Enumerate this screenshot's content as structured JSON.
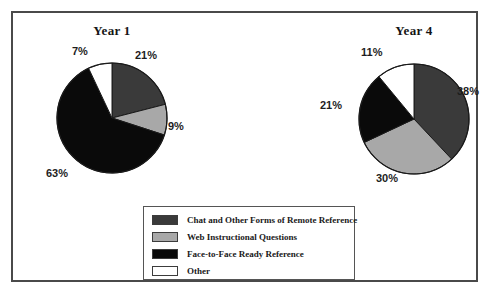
{
  "figure": {
    "border_color": "#4a4a4a",
    "background": "#ffffff"
  },
  "charts": [
    {
      "title": "Year 1",
      "cx": 110,
      "cy": 116,
      "r": 55,
      "title_left": 40,
      "title_top": 21,
      "labels": [
        {
          "text": "21%",
          "left": 133,
          "top": 47
        },
        {
          "text": "9%",
          "left": 166,
          "top": 118
        },
        {
          "text": "63%",
          "left": 44,
          "top": 165
        },
        {
          "text": "7%",
          "left": 70,
          "top": 43
        }
      ]
    },
    {
      "title": "Year 4",
      "cx": 412,
      "cy": 117,
      "r": 55,
      "title_left": 342,
      "title_top": 21,
      "labels": [
        {
          "text": "38%",
          "left": 455,
          "top": 83
        },
        {
          "text": "30%",
          "left": 374,
          "top": 170
        },
        {
          "text": "21%",
          "left": 318,
          "top": 97
        },
        {
          "text": "11%",
          "left": 359,
          "top": 44
        }
      ]
    }
  ],
  "legend": {
    "items": [
      {
        "label": "Chat and Other Forms of Remote Reference",
        "color": "#3a3a3a"
      },
      {
        "label": "Web Instructional Questions",
        "color": "#a8a8a8"
      },
      {
        "label": "Face-to-Face Ready Reference",
        "color": "#0a0a0a"
      },
      {
        "label": "Other",
        "color": "#ffffff"
      }
    ]
  },
  "chart_data": {
    "type": "pie",
    "title": "",
    "legend_position": "bottom-center",
    "series_labels": [
      "Chat and Other Forms of Remote Reference",
      "Web Instructional Questions",
      "Face-to-Face Ready Reference",
      "Other"
    ],
    "colors": [
      "#3a3a3a",
      "#a8a8a8",
      "#0a0a0a",
      "#ffffff"
    ],
    "charts": [
      {
        "title": "Year 1",
        "categories": [
          "Chat and Other Forms of Remote Reference",
          "Web Instructional Questions",
          "Face-to-Face Ready Reference",
          "Other"
        ],
        "values": [
          21,
          9,
          63,
          7
        ],
        "unit": "%",
        "start_angle_deg": 0,
        "direction": "clockwise"
      },
      {
        "title": "Year 4",
        "categories": [
          "Chat and Other Forms of Remote Reference",
          "Web Instructional Questions",
          "Face-to-Face Ready Reference",
          "Other"
        ],
        "values": [
          38,
          30,
          21,
          11
        ],
        "unit": "%",
        "start_angle_deg": 0,
        "direction": "clockwise"
      }
    ]
  }
}
